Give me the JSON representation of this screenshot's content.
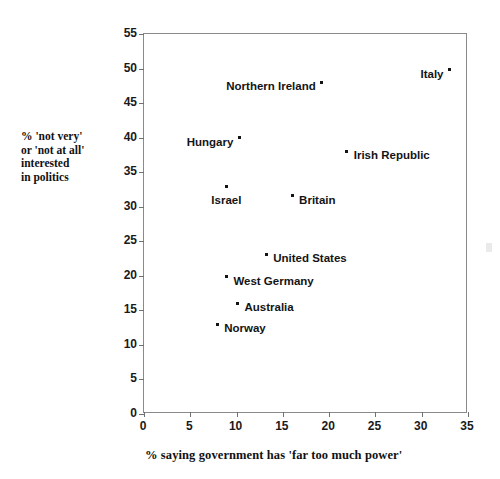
{
  "chart_data": {
    "type": "scatter",
    "title": "",
    "xlabel": "% saying government has 'far too much power'",
    "ylabel": "% 'not very' or 'not at all' interested in politics",
    "ylabel_lines": [
      "% 'not very'",
      "or 'not at all'",
      "interested",
      "in politics"
    ],
    "xlim": [
      0,
      35
    ],
    "ylim": [
      0,
      55
    ],
    "xticks": [
      0,
      5,
      10,
      15,
      20,
      25,
      30,
      35
    ],
    "yticks": [
      0,
      5,
      10,
      15,
      20,
      25,
      30,
      35,
      40,
      45,
      50,
      55
    ],
    "grid": false,
    "legend": "none",
    "marker_color": "#141414",
    "points": [
      {
        "label": "Italy",
        "x": 33.0,
        "y": 49.8,
        "label_pos": "left"
      },
      {
        "label": "Northern Ireland",
        "x": 19.2,
        "y": 48.0,
        "label_pos": "left"
      },
      {
        "label": "Irish Republic",
        "x": 21.9,
        "y": 38.0,
        "label_pos": "right"
      },
      {
        "label": "Hungary",
        "x": 10.3,
        "y": 40.0,
        "label_pos": "left"
      },
      {
        "label": "Israel",
        "x": 8.9,
        "y": 33.0,
        "label_pos": "below"
      },
      {
        "label": "Britain",
        "x": 16.0,
        "y": 31.6,
        "label_pos": "right"
      },
      {
        "label": "United States",
        "x": 13.2,
        "y": 23.1,
        "label_pos": "right"
      },
      {
        "label": "West Germany",
        "x": 8.9,
        "y": 19.9,
        "label_pos": "right"
      },
      {
        "label": "Australia",
        "x": 10.1,
        "y": 16.0,
        "label_pos": "right"
      },
      {
        "label": "Norway",
        "x": 7.9,
        "y": 13.0,
        "label_pos": "right"
      }
    ]
  }
}
